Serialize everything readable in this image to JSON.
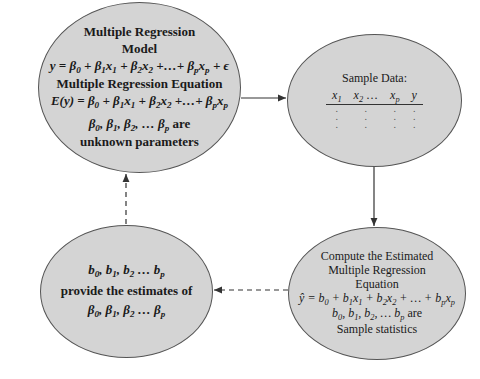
{
  "colors": {
    "node_fill": "#d4d4d4",
    "node_stroke": "#555555",
    "arrow": "#333333",
    "background": "#ffffff"
  },
  "nodes": {
    "population": {
      "title_line1": "Multiple Regression",
      "title_line2": "Model",
      "model_eq": "y = β0 + β1x1 + β2x2 +…+ βpxp + ε",
      "eq_title": "Multiple Regression Equation",
      "expect_eq": "E(y) = β0 + β1x1 + β2x2 +…+ βpxp",
      "params_line1": "β0, β1, β2, … βp are",
      "params_line2": "unknown parameters"
    },
    "sample": {
      "title": "Sample Data:",
      "columns": [
        "x1",
        "x2 …",
        "xp",
        "y"
      ],
      "rows": [
        [
          ".",
          ".",
          ".",
          "."
        ],
        [
          ".",
          ".",
          ".",
          "."
        ],
        [
          ".",
          ".",
          ".",
          "."
        ]
      ]
    },
    "compute": {
      "line1": "Compute the Estimated",
      "line2": "Multiple Regression",
      "line3": "Equation",
      "est_eq": "ŷ = b0 + b1x1 + b2x2 + … + bpxp",
      "stats_line1": "b0, b1, b2, … bp are",
      "stats_line2": "Sample statistics"
    },
    "estimates": {
      "line1": "b0, b1, b2 … bp",
      "line2": "provide the estimates of",
      "line3": "β0, β1, β2 … βp"
    }
  },
  "edges": [
    {
      "from": "population",
      "to": "sample",
      "style": "solid"
    },
    {
      "from": "sample",
      "to": "compute",
      "style": "solid"
    },
    {
      "from": "compute",
      "to": "estimates",
      "style": "dashed"
    },
    {
      "from": "estimates",
      "to": "population",
      "style": "dashed"
    }
  ]
}
